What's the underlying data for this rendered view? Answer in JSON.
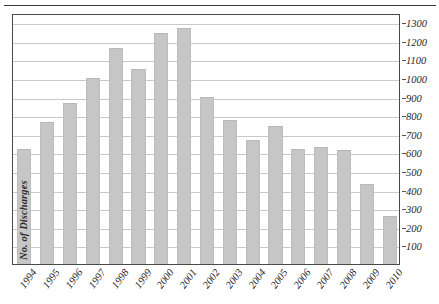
{
  "chart_data": {
    "type": "bar",
    "title": "",
    "subtitle": "",
    "xlabel": "",
    "ylabel": "No. of Discharges",
    "categories": [
      "1994",
      "1995",
      "1996",
      "1997",
      "1998",
      "1999",
      "2000",
      "2001",
      "2002",
      "2003",
      "2004",
      "2005",
      "2006",
      "2007",
      "2008",
      "2009",
      "2010"
    ],
    "values": [
      620,
      765,
      865,
      1000,
      1160,
      1050,
      1240,
      1270,
      900,
      775,
      665,
      740,
      620,
      630,
      615,
      430,
      260
    ],
    "series": [
      {
        "name": "No. of Discharges",
        "values": [
          620,
          765,
          865,
          1000,
          1160,
          1050,
          1240,
          1270,
          900,
          775,
          665,
          740,
          620,
          630,
          615,
          430,
          260
        ]
      }
    ],
    "ylim": [
      0,
      1350
    ],
    "y_ticks": [
      1300,
      1200,
      1100,
      1000,
      900,
      800,
      700,
      600,
      500,
      400,
      300,
      200,
      100
    ],
    "y_tick_labels": [
      "1300",
      "1200",
      "1100",
      "1000",
      "900",
      "800",
      "700",
      "600",
      "500",
      "400",
      "300",
      "200",
      "100"
    ],
    "grid": true,
    "grid_axis": "y",
    "legend": false,
    "legend_position": "none",
    "y_axis_position": "right",
    "bar_color": "#c6c6c6",
    "grid_color": "#c9c9c9",
    "frame_color": "#4a4a4a",
    "annotations": []
  },
  "axis_title": {
    "y": "No. of Discharges"
  }
}
